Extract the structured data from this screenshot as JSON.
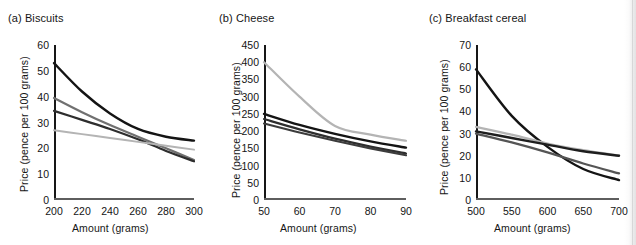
{
  "figure": {
    "shared_xlabel": "Amount (grams)",
    "shared_ylabel": "Price (pence per 100 grams)",
    "colors": {
      "dark": "#141414",
      "mid_dark": "#2e2e2e",
      "mid_gray": "#707070",
      "light_gray": "#b4b4b4",
      "axis": "#171717",
      "baseline": "#5e5e5e"
    }
  },
  "chart_data": [
    {
      "type": "line",
      "panel": "a",
      "title": "(a) Biscuits",
      "xlabel": "Amount (grams)",
      "ylabel": "Price (pence per 100 grams)",
      "xlim": [
        200,
        300
      ],
      "ylim": [
        0,
        60
      ],
      "xticks": [
        200,
        220,
        240,
        260,
        280,
        300
      ],
      "yticks": [
        0,
        10,
        20,
        30,
        40,
        50,
        60
      ],
      "grid": false,
      "legend": "none",
      "x": [
        200,
        220,
        240,
        260,
        280,
        300
      ],
      "series": [
        {
          "name": "curve-1",
          "color": "#141414",
          "width": 2.4,
          "values": [
            53,
            42,
            33.5,
            27.5,
            24.5,
            23
          ]
        },
        {
          "name": "curve-2",
          "color": "#707070",
          "width": 2.2,
          "values": [
            39.5,
            34,
            29,
            24.5,
            20,
            15.5
          ]
        },
        {
          "name": "curve-3",
          "color": "#2e2e2e",
          "width": 2.2,
          "values": [
            34.5,
            31,
            27.5,
            23.5,
            19,
            15
          ]
        },
        {
          "name": "curve-4",
          "color": "#b4b4b4",
          "width": 2.0,
          "values": [
            27,
            25.5,
            24,
            22.5,
            21,
            19.5
          ]
        }
      ]
    },
    {
      "type": "line",
      "panel": "b",
      "title": "(b) Cheese",
      "xlabel": "Amount (grams)",
      "ylabel": "Price (pence per 100 grams)",
      "xlim": [
        50,
        90
      ],
      "ylim": [
        0,
        450
      ],
      "xticks": [
        50,
        60,
        70,
        80,
        90
      ],
      "yticks": [
        0,
        50,
        100,
        150,
        200,
        250,
        300,
        350,
        400,
        450
      ],
      "grid": false,
      "legend": "none",
      "x": [
        50,
        60,
        70,
        80,
        90
      ],
      "series": [
        {
          "name": "curve-1",
          "color": "#b4b4b4",
          "width": 2.2,
          "values": [
            400,
            300,
            215,
            190,
            172
          ]
        },
        {
          "name": "curve-2",
          "color": "#141414",
          "width": 2.4,
          "values": [
            250,
            218,
            192,
            170,
            152
          ]
        },
        {
          "name": "curve-3",
          "color": "#2e2e2e",
          "width": 2.2,
          "values": [
            235,
            205,
            178,
            155,
            135
          ]
        },
        {
          "name": "curve-4",
          "color": "#3c3c3c",
          "width": 2.2,
          "values": [
            222,
            196,
            172,
            150,
            130
          ]
        }
      ]
    },
    {
      "type": "line",
      "panel": "c",
      "title": "(c) Breakfast cereal",
      "xlabel": "Amount (grams)",
      "ylabel": "Price (pence per 100 grams)",
      "xlim": [
        500,
        700
      ],
      "ylim": [
        0,
        70
      ],
      "xticks": [
        500,
        550,
        600,
        650,
        700
      ],
      "yticks": [
        0,
        10,
        20,
        30,
        40,
        50,
        60,
        70
      ],
      "grid": false,
      "legend": "none",
      "x": [
        500,
        550,
        600,
        650,
        700
      ],
      "series": [
        {
          "name": "curve-1",
          "color": "#141414",
          "width": 2.4,
          "values": [
            59,
            38,
            24,
            14,
            9
          ]
        },
        {
          "name": "curve-2",
          "color": "#b4b4b4",
          "width": 2.2,
          "values": [
            33,
            29.5,
            25.5,
            22.5,
            20
          ]
        },
        {
          "name": "curve-3",
          "color": "#1e1e1e",
          "width": 2.4,
          "values": [
            31,
            28,
            25,
            22,
            20
          ]
        },
        {
          "name": "curve-4",
          "color": "#555555",
          "width": 2.2,
          "values": [
            30,
            26,
            21.5,
            16.5,
            12
          ]
        }
      ]
    }
  ]
}
